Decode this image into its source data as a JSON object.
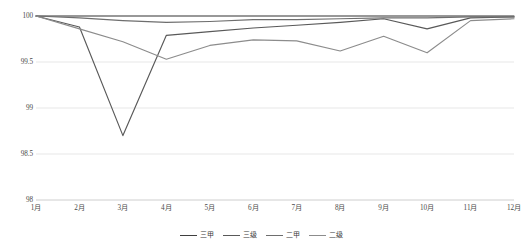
{
  "chart_data": {
    "type": "line",
    "title": "",
    "subtitle": "",
    "xlabel": "",
    "ylabel": "",
    "categories": [
      "1月",
      "2月",
      "3月",
      "4月",
      "5月",
      "6月",
      "7月",
      "8月",
      "9月",
      "10月",
      "11月",
      "12月"
    ],
    "ylim": [
      98,
      100
    ],
    "yticks": [
      98,
      98.5,
      99,
      99.5,
      100
    ],
    "ytick_labels": [
      "98",
      "98.5",
      "99",
      "99.5",
      "100"
    ],
    "grid": true,
    "grid_axis": "y",
    "legend_position": "bottom-center",
    "series": [
      {
        "name": "三甲",
        "color": "#3f3f3f",
        "values": [
          100,
          100,
          100,
          100,
          100,
          100,
          100,
          100,
          100,
          100,
          100,
          100
        ]
      },
      {
        "name": "三级",
        "color": "#595959",
        "values": [
          100,
          99.88,
          98.7,
          99.79,
          99.83,
          99.87,
          99.9,
          99.93,
          99.97,
          99.86,
          99.98,
          99.99
        ]
      },
      {
        "name": "二甲",
        "color": "#6e6e6e",
        "values": [
          100,
          99.98,
          99.95,
          99.93,
          99.94,
          99.96,
          99.96,
          99.97,
          99.98,
          99.98,
          99.99,
          99.99
        ]
      },
      {
        "name": "二级",
        "color": "#8c8c8c",
        "values": [
          100,
          99.86,
          99.72,
          99.53,
          99.68,
          99.74,
          99.73,
          99.62,
          99.78,
          99.6,
          99.95,
          99.97
        ]
      }
    ]
  }
}
